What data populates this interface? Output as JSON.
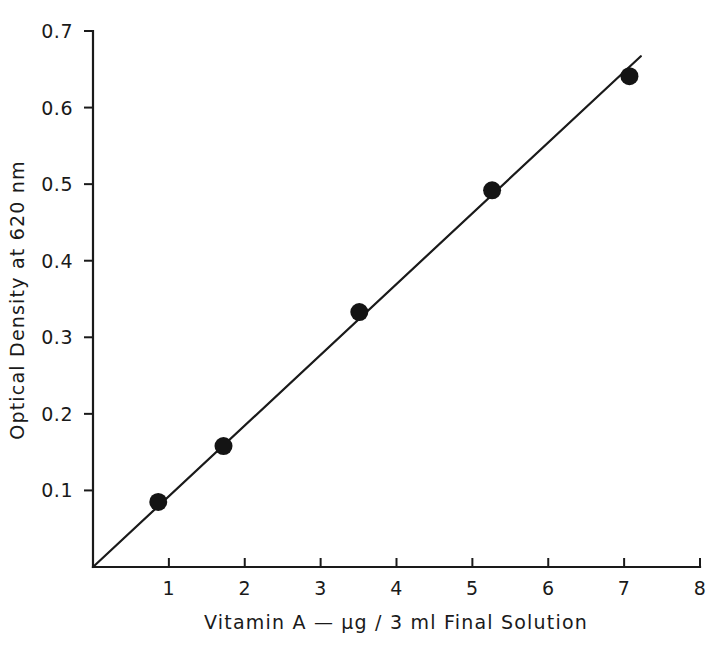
{
  "chart_data": {
    "type": "scatter",
    "title": "",
    "subtitle": "",
    "xlabel": "Vitamin A — µg / 3 ml Final Solution",
    "ylabel": "Optical Density at 620 nm",
    "xlim": [
      0,
      8
    ],
    "ylim": [
      0,
      0.7
    ],
    "grid": false,
    "legend": null,
    "x_ticks": [
      {
        "value": 1,
        "label": "1"
      },
      {
        "value": 2,
        "label": "2"
      },
      {
        "value": 3,
        "label": "3"
      },
      {
        "value": 4,
        "label": "4"
      },
      {
        "value": 5,
        "label": "5"
      },
      {
        "value": 6,
        "label": "6"
      },
      {
        "value": 7,
        "label": "7"
      },
      {
        "value": 8,
        "label": "8"
      }
    ],
    "y_ticks": [
      {
        "value": 0.1,
        "label": "0.1"
      },
      {
        "value": 0.2,
        "label": "0.2"
      },
      {
        "value": 0.3,
        "label": "0.3"
      },
      {
        "value": 0.4,
        "label": "0.4"
      },
      {
        "value": 0.5,
        "label": "0.5"
      },
      {
        "value": 0.6,
        "label": "0.6"
      },
      {
        "value": 0.7,
        "label": "0.7"
      }
    ],
    "series": [
      {
        "name": "Vitamin A standard curve",
        "marker": "filled-circle",
        "color": "#141414",
        "x": [
          0.86,
          1.72,
          3.51,
          5.26,
          7.07
        ],
        "y": [
          0.085,
          0.158,
          0.333,
          0.492,
          0.641
        ]
      }
    ],
    "fit_line": {
      "name": "best-fit line through origin",
      "color": "#1a1a1a",
      "x": [
        0.0,
        7.22
      ],
      "y": [
        0.0,
        0.667
      ]
    }
  },
  "axis_titles": {
    "x": "Vitamin A — µg / 3 ml Final Solution",
    "y": "Optical Density at 620 nm"
  }
}
